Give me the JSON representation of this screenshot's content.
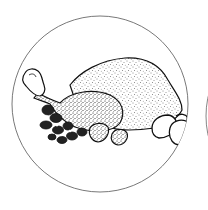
{
  "image": {
    "subject": "roast-turkey-illustration",
    "style": "stippled pen-and-ink drawing",
    "elements": [
      "frame-circle",
      "turkey-body",
      "drumstick",
      "vegetables-garnish",
      "potatoes",
      "adjacent-circle-partial"
    ],
    "colors": {
      "background": "#ffffff",
      "ink": "#111111",
      "frame_stroke": "#555555"
    }
  }
}
